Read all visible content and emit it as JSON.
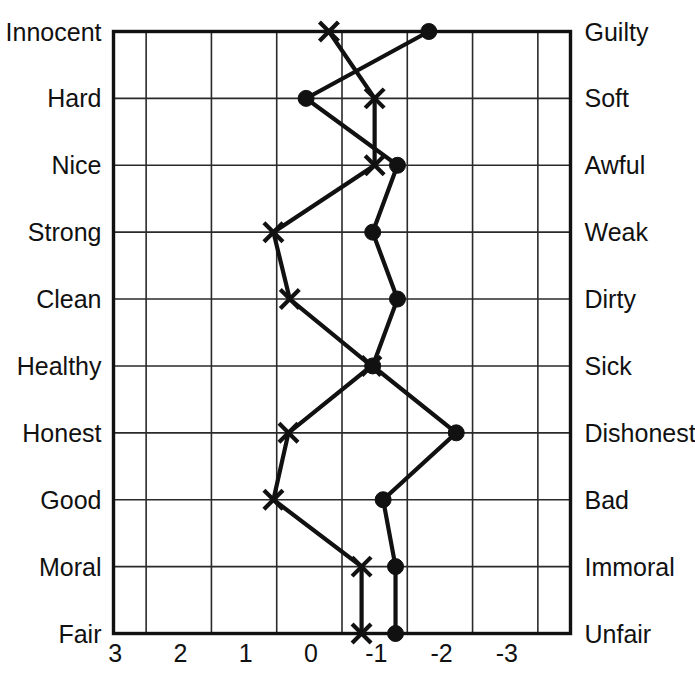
{
  "chart_data": {
    "type": "line",
    "title": "",
    "subtitle": "",
    "xlabel": "",
    "ylabel": "",
    "orientation": "horizontal-semantic-differential",
    "grid": true,
    "legend_position": "none",
    "xlim": [
      3.5,
      -3.5
    ],
    "x_axis_direction": "reversed",
    "tick_labels": [
      "3",
      "2",
      "1",
      "0",
      "-1",
      "-2",
      "-3"
    ],
    "tick_values": [
      3,
      2,
      1,
      0,
      -1,
      -2,
      -3
    ],
    "categories": [
      "Innocent-Guilty",
      "Hard-Soft",
      "Nice-Awful",
      "Strong-Weak",
      "Clean-Dirty",
      "Healthy-Sick",
      "Honest-Dishonest",
      "Good-Bad",
      "Moral-Immoral",
      "Fair-Unfair"
    ],
    "left_labels": [
      "Innocent",
      "Hard",
      "Nice",
      "Strong",
      "Clean",
      "Healthy",
      "Honest",
      "Good",
      "Moral",
      "Fair"
    ],
    "right_labels": [
      "Guilty",
      "Soft",
      "Awful",
      "Weak",
      "Dirty",
      "Sick",
      "Dishonest",
      "Bad",
      "Immoral",
      "Unfair"
    ],
    "series": [
      {
        "name": "Series X",
        "marker": "cross",
        "values": [
          0.2,
          -0.5,
          -0.5,
          1.05,
          0.8,
          -0.45,
          0.82,
          1.05,
          -0.3,
          -0.3
        ]
      },
      {
        "name": "Series Dot",
        "marker": "circle",
        "values": [
          -1.33,
          0.55,
          -0.85,
          -0.47,
          -0.85,
          -0.47,
          -1.75,
          -0.63,
          -0.82,
          -0.82
        ]
      }
    ],
    "colors": {
      "line": "#111111",
      "grid": "#2a2a2a",
      "frame": "#111111",
      "background": "#ffffff"
    }
  }
}
